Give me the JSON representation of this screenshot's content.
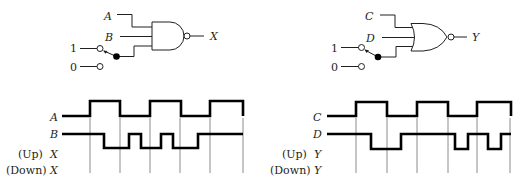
{
  "left_circuit": {
    "gate_type": "NAND",
    "inputs": [
      "A",
      "B"
    ],
    "output": "X",
    "switch": {
      "options": [
        "1",
        "0"
      ],
      "position": "1"
    }
  },
  "right_circuit": {
    "gate_type": "NOR",
    "inputs": [
      "C",
      "D"
    ],
    "output": "Y",
    "switch": {
      "options": [
        "1",
        "0"
      ],
      "position": "1"
    }
  },
  "left_timing": {
    "signals": [
      {
        "label": "A",
        "prefix": ""
      },
      {
        "label": "B",
        "prefix": ""
      },
      {
        "label": "X",
        "prefix": "(Up)"
      },
      {
        "label": "X",
        "prefix": "(Down)"
      }
    ],
    "waveforms": {
      "A": "62,116 90,116 90,101 120,101 120,116 150,116 150,101 181,101 181,116 210,116 210,101 243,101 243,116",
      "B": "62,134 104,134 104,148 129,148 129,134 141,134 141,148 161,148 161,134 173,134 173,148 198,148 198,134 243,134"
    },
    "grid_x": [
      90,
      120,
      150,
      180,
      210,
      243
    ]
  },
  "right_timing": {
    "signals": [
      {
        "label": "C",
        "prefix": ""
      },
      {
        "label": "D",
        "prefix": ""
      },
      {
        "label": "Y",
        "prefix": "(Up)"
      },
      {
        "label": "Y",
        "prefix": "(Down)"
      }
    ],
    "waveforms": {
      "C": "327,116 356,116 356,102 387,102 387,116 417,116 417,102 448,102 448,116 477,116 477,102 511,102 511,116",
      "D": "327,134 371,134 371,149 401,149 401,134 455,134 455,149 468,149 468,134 488,134 488,149 501,149 501,134 511,134"
    },
    "grid_x": [
      356,
      387,
      417,
      448,
      477,
      510
    ]
  }
}
